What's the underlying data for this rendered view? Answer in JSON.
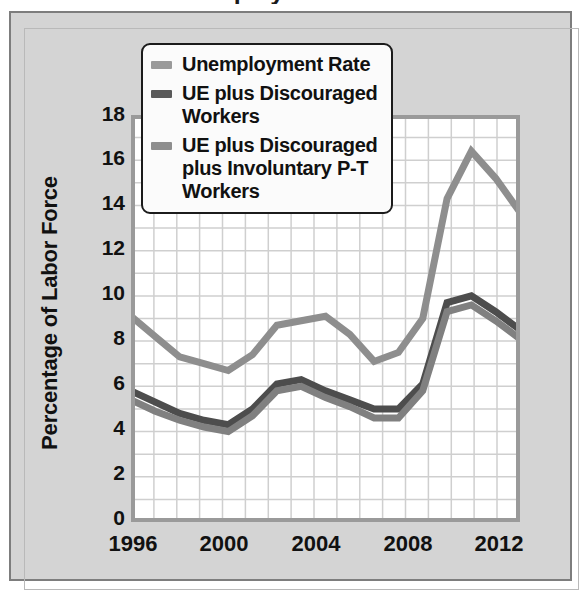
{
  "chart_data": {
    "type": "line",
    "title": "Unemployment Rates",
    "xlabel": "",
    "ylabel": "Percentage of Labor Force",
    "ylim": [
      0,
      18
    ],
    "xlim": [
      1996,
      2012
    ],
    "ytick_step": 2,
    "yticks": [
      "0",
      "2",
      "4",
      "6",
      "8",
      "10",
      "12",
      "14",
      "16",
      "18"
    ],
    "xticks": [
      "1996",
      "2000",
      "2004",
      "2008",
      "2012"
    ],
    "grid": true,
    "grid_x_step": 1,
    "grid_y_step": 1,
    "legend_position": "top-left",
    "x": [
      1996,
      1997,
      1998,
      1999,
      2000,
      2001,
      2002,
      2003,
      2004,
      2005,
      2006,
      2007,
      2008,
      2009,
      2010,
      2011,
      2012
    ],
    "series": [
      {
        "name": "Unemployment Rate",
        "color": "#808080",
        "values": [
          5.4,
          4.9,
          4.5,
          4.2,
          4.0,
          4.7,
          5.8,
          6.0,
          5.5,
          5.1,
          4.6,
          4.6,
          5.8,
          9.3,
          9.6,
          8.9,
          8.1
        ]
      },
      {
        "name": "UE plus Discouraged Workers",
        "color": "#4d4d4d",
        "values": [
          5.8,
          5.3,
          4.8,
          4.5,
          4.3,
          5.0,
          6.1,
          6.3,
          5.8,
          5.4,
          5.0,
          5.0,
          6.1,
          9.7,
          10.0,
          9.3,
          8.5
        ]
      },
      {
        "name": "UE plus Discouraged plus Involuntary P-T Workers",
        "color": "#8e8e8e",
        "values": [
          9.1,
          8.2,
          7.3,
          7.0,
          6.7,
          7.4,
          8.7,
          8.9,
          9.1,
          8.3,
          7.1,
          7.5,
          9.0,
          14.3,
          16.4,
          15.2,
          13.7
        ]
      }
    ]
  },
  "legend": {
    "items": [
      {
        "label": "Unemployment Rate",
        "swatch_color": "#9a9a9a"
      },
      {
        "label": "UE plus Discouraged Workers",
        "swatch_color": "#5a5a5a"
      },
      {
        "label": "UE plus Discouraged plus Involuntary P-T Workers",
        "swatch_color": "#8e8e8e"
      }
    ]
  },
  "axis": {
    "y_title": "Percentage of Labor Force"
  },
  "colors": {
    "card_background": "#d4d4d4",
    "plot_background": "#ffffff",
    "frame": "#9a9a9a",
    "gridline": "#cfcfcf",
    "text": "#111111"
  }
}
